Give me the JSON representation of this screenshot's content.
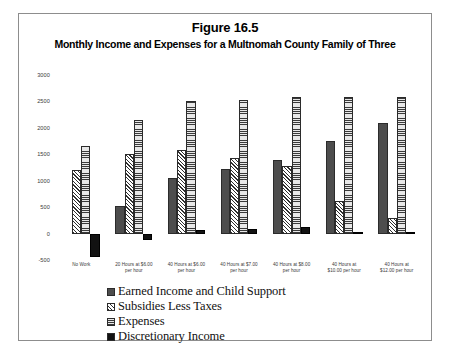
{
  "figure": {
    "number": "Figure 16.5",
    "subtitle": "Monthly Income and Expenses for a Multnomah County Family of Three"
  },
  "chart_data": {
    "type": "bar",
    "title": "Figure 16.5",
    "subtitle": "Monthly Income and Expenses for a Multnomah County Family of Three",
    "xlabel": "",
    "ylabel": "",
    "ylim": [
      -500,
      3000
    ],
    "yticks": [
      -500,
      0,
      500,
      1000,
      1500,
      2000,
      2500,
      3000
    ],
    "ytick_labels": [
      "-500",
      "0",
      "500",
      "1000",
      "1500",
      "2000",
      "2500",
      "3000"
    ],
    "grid": false,
    "legend_position": "bottom-center",
    "categories": [
      "No Work",
      "20 Hours at $6.00 per hour",
      "40 Hours at $6.00 per hour",
      "40 Hours at $7.00 per hour",
      "40 Hours at $8.00 per hour",
      "40 Hours at $10.00 per hour",
      "40 Hours at $12.00 per hour"
    ],
    "category_lines": [
      [
        "No Work",
        ""
      ],
      [
        "20 Hours at $6.00",
        "per hour"
      ],
      [
        "40 Hours at $6.00",
        "per hour"
      ],
      [
        "40 Hours at $7.00",
        "per hour"
      ],
      [
        "40 Hours at $8.00",
        "per hour"
      ],
      [
        "40 Hours at",
        "$10.00 per hour"
      ],
      [
        "40 Hours at",
        "$12.00 per hour"
      ]
    ],
    "series": [
      {
        "name": "Earned Income and Child Support",
        "pattern": "solid-dark",
        "values": [
          0,
          520,
          1050,
          1220,
          1400,
          1750,
          2100
        ]
      },
      {
        "name": "Subsidies Less Taxes",
        "pattern": "diagonal-hatch",
        "values": [
          1200,
          1500,
          1580,
          1430,
          1280,
          620,
          300
        ]
      },
      {
        "name": "Expenses",
        "pattern": "horizontal-lines",
        "values": [
          1650,
          2150,
          2500,
          2520,
          2580,
          2580,
          2580
        ]
      },
      {
        "name": "Discretionary Income",
        "pattern": "solid-black",
        "values": [
          -450,
          -130,
          60,
          80,
          120,
          20,
          30
        ]
      }
    ]
  },
  "legend": {
    "items": [
      {
        "label": "Earned Income and Child Support"
      },
      {
        "label": "Subsidies Less Taxes"
      },
      {
        "label": "Expenses"
      },
      {
        "label": "Discretionary Income"
      }
    ]
  }
}
